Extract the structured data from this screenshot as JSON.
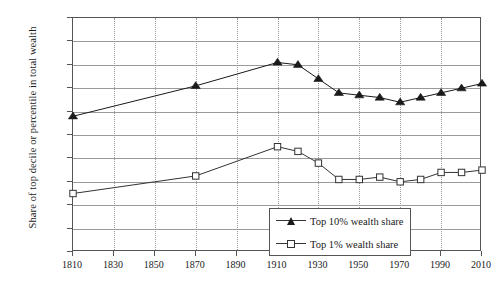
{
  "chart_data": {
    "type": "line",
    "title": "",
    "subtitle": "",
    "xlabel": "",
    "ylabel": "Share of top decile or percentile in total wealth",
    "xlim": [
      1810,
      2010
    ],
    "ylim": [
      0,
      100
    ],
    "grid": true,
    "legend_position": "inside-center-bottom",
    "y_ticks": [
      "0%",
      "10%",
      "20%",
      "30%",
      "40%",
      "50%",
      "60%",
      "70%",
      "80%",
      "90%",
      "100%"
    ],
    "y_tick_values": [
      0,
      10,
      20,
      30,
      40,
      50,
      60,
      70,
      80,
      90,
      100
    ],
    "x_ticks": [
      "1810",
      "1830",
      "1850",
      "1870",
      "1890",
      "1910",
      "1930",
      "1950",
      "1970",
      "1990",
      "2010"
    ],
    "x_tick_values": [
      1810,
      1830,
      1850,
      1870,
      1890,
      1910,
      1930,
      1950,
      1970,
      1990,
      2010
    ],
    "x": [
      1810,
      1870,
      1910,
      1920,
      1930,
      1940,
      1950,
      1960,
      1970,
      1980,
      1990,
      2000,
      2010
    ],
    "series": [
      {
        "name": "Top 10% wealth share",
        "marker": "filled-triangle",
        "color": "#1a1a1a",
        "values": [
          58,
          71,
          81,
          80,
          74,
          68,
          67,
          66,
          64,
          66,
          68,
          70,
          72
        ]
      },
      {
        "name": "Top 1% wealth share",
        "marker": "open-square",
        "color": "#333333",
        "values": [
          25,
          32.5,
          45,
          43,
          38,
          31,
          31,
          32,
          30,
          31,
          34,
          34,
          35
        ]
      }
    ]
  },
  "legend": {
    "entries": [
      {
        "label": "Top 10% wealth share"
      },
      {
        "label": "Top 1% wealth share"
      }
    ]
  },
  "axes": {
    "y_title": "Share of top decile or percentile in total wealth"
  }
}
